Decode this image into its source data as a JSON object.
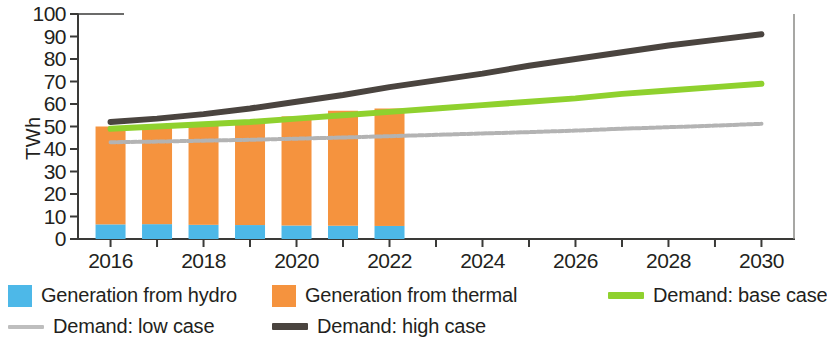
{
  "chart_data": {
    "type": "bar",
    "title": "",
    "xlabel": "",
    "ylabel": "TWh",
    "ylim": [
      0,
      100
    ],
    "xlim": [
      2015.3,
      2030.7
    ],
    "ytick_labels": [
      "100",
      "90",
      "80",
      "70",
      "60",
      "50",
      "40",
      "30",
      "20",
      "10",
      "0"
    ],
    "ytick_values": [
      100,
      90,
      80,
      70,
      60,
      50,
      40,
      30,
      20,
      10,
      0
    ],
    "xtick_labels": [
      "2016",
      "2018",
      "2020",
      "2022",
      "2024",
      "2026",
      "2028",
      "2030"
    ],
    "xtick_values": [
      2016,
      2018,
      2020,
      2022,
      2024,
      2026,
      2028,
      2030
    ],
    "xtick_minor_values": [
      2016,
      2017,
      2018,
      2019,
      2020,
      2021,
      2022,
      2023,
      2024,
      2025,
      2026,
      2027,
      2028,
      2029,
      2030
    ],
    "grid": false,
    "legend_position": "bottom",
    "bar_categories": [
      2016,
      2017,
      2018,
      2019,
      2020,
      2021,
      2022
    ],
    "series": [
      {
        "name": "Generation from hydro",
        "kind": "bar",
        "stack": "generation",
        "color": "#4db8e8",
        "values": [
          6.5,
          6.6,
          6.3,
          6.2,
          6.0,
          5.9,
          5.8
        ]
      },
      {
        "name": "Generation from thermal",
        "kind": "bar",
        "stack": "generation",
        "color": "#f5933e",
        "values": [
          43.5,
          42.9,
          44.2,
          46.3,
          48.5,
          51.1,
          52.2
        ]
      },
      {
        "name": "Demand: base case",
        "kind": "line",
        "color": "#8fd12e",
        "x": [
          2016,
          2017,
          2018,
          2019,
          2020,
          2021,
          2022,
          2023,
          2024,
          2025,
          2026,
          2027,
          2028,
          2029,
          2030
        ],
        "values": [
          49.0,
          50.0,
          51.0,
          52.0,
          53.5,
          55.0,
          56.5,
          58.0,
          59.5,
          61.0,
          62.5,
          64.5,
          66.0,
          67.5,
          69.0
        ]
      },
      {
        "name": "Demand: low case",
        "kind": "line",
        "color": "#b3b3b3",
        "x": [
          2016,
          2017,
          2018,
          2019,
          2020,
          2021,
          2022,
          2023,
          2024,
          2025,
          2026,
          2027,
          2028,
          2029,
          2030
        ],
        "values": [
          43.0,
          43.3,
          43.7,
          44.1,
          44.6,
          45.1,
          45.7,
          46.3,
          46.9,
          47.5,
          48.2,
          49.0,
          49.7,
          50.4,
          51.2
        ]
      },
      {
        "name": "Demand: high case",
        "kind": "line",
        "color": "#4a443f",
        "x": [
          2016,
          2017,
          2018,
          2019,
          2020,
          2021,
          2022,
          2023,
          2024,
          2025,
          2026,
          2027,
          2028,
          2029,
          2030
        ],
        "values": [
          52.0,
          53.5,
          55.5,
          58.0,
          61.0,
          64.0,
          67.5,
          70.5,
          73.5,
          77.0,
          80.0,
          83.0,
          86.0,
          88.5,
          91.0
        ]
      }
    ]
  },
  "legend": {
    "items": [
      {
        "label": "Generation from hydro",
        "color": "#4db8e8",
        "marker": "box"
      },
      {
        "label": "Generation from thermal",
        "color": "#f5933e",
        "marker": "box"
      },
      {
        "label": "Demand: base case",
        "color": "#8fd12e",
        "marker": "line"
      },
      {
        "label": "Demand: low case",
        "color": "#b3b3b3",
        "marker": "dotted"
      },
      {
        "label": "Demand: high case",
        "color": "#4a443f",
        "marker": "line"
      }
    ]
  },
  "colors": {
    "hydro": "#4db8e8",
    "thermal": "#f5933e",
    "base_case": "#8fd12e",
    "low_case": "#b3b3b3",
    "high_case": "#4a443f",
    "axis": "#3a3a38",
    "text": "#231f20",
    "background": "#ffffff"
  }
}
